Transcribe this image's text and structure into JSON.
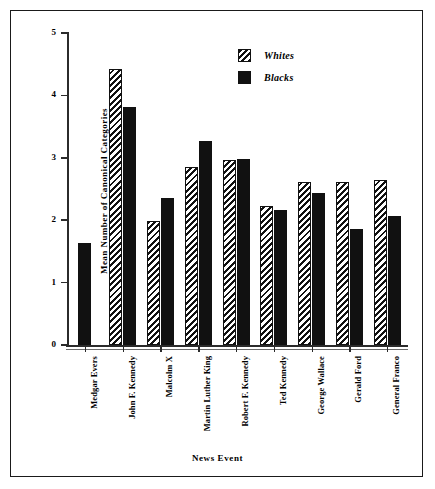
{
  "chart_data": {
    "type": "bar",
    "title": "",
    "xlabel": "News Event",
    "ylabel": "Mean Number of Canonical Categories",
    "ylim": [
      0,
      5
    ],
    "yticks": [
      0,
      1,
      2,
      3,
      4,
      5
    ],
    "ytick_labels": [
      "0",
      "1",
      "2",
      "3",
      "4",
      "5"
    ],
    "grid": false,
    "legend_position": "top-right",
    "categories": [
      "Medgar Evers",
      "John F. Kennedy",
      "Malcolm X",
      "Martin Luther King",
      "Robert F. Kennedy",
      "Ted Kennedy",
      "George Wallace",
      "Gerald Ford",
      "General Franco"
    ],
    "series": [
      {
        "name": "Whites",
        "fill": "hatched",
        "values": [
          null,
          4.43,
          1.98,
          2.85,
          2.97,
          2.22,
          2.62,
          2.62,
          2.65
        ]
      },
      {
        "name": "Blacks",
        "fill": "solid-black",
        "values": [
          1.63,
          3.82,
          2.35,
          3.27,
          2.98,
          2.17,
          2.43,
          1.86,
          2.06
        ]
      }
    ]
  },
  "legend": {
    "items": [
      {
        "label": "Whites",
        "swatch": "hatched"
      },
      {
        "label": "Blacks",
        "swatch": "solid-black"
      }
    ]
  },
  "axes": {
    "y_title": "Mean Number of Canonical Categories",
    "x_title": "News Event"
  },
  "colors": {
    "ink": "#111111",
    "axis": "#2b2b2b",
    "background": "#ffffff"
  }
}
